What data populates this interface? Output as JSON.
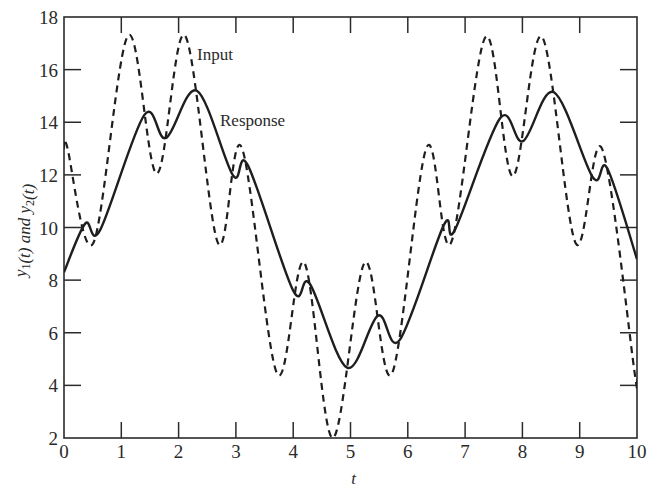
{
  "chart_data": {
    "type": "line",
    "title": "",
    "xlabel": "t",
    "ylabel": "y1(t) and y2(t)",
    "xlim": [
      0,
      10
    ],
    "ylim": [
      2,
      18
    ],
    "xticks": [
      0,
      1,
      2,
      3,
      4,
      5,
      6,
      7,
      8,
      9,
      10
    ],
    "yticks": [
      2,
      4,
      6,
      8,
      10,
      12,
      14,
      16,
      18
    ],
    "grid": false,
    "legend": "inline annotations",
    "annotations": [
      {
        "text": "Input",
        "x": 2.33,
        "y": 16.5
      },
      {
        "text": "Response",
        "x": 2.73,
        "y": 14.0
      }
    ],
    "series": [
      {
        "name": "Input",
        "style": "dashed",
        "x": [
          0,
          0.05,
          0.51,
          1.12,
          1.62,
          2.11,
          2.69,
          3.1,
          3.72,
          4.19,
          4.69,
          5.25,
          5.72,
          6.33,
          6.75,
          7.36,
          7.83,
          8.34,
          8.93,
          9.39,
          9.97,
          10
        ],
        "y": [
          13.0,
          13.1,
          9.4,
          17.3,
          12.05,
          17.3,
          9.4,
          13.05,
          4.44,
          8.67,
          2.0,
          8.67,
          4.44,
          13.05,
          9.4,
          17.25,
          11.95,
          17.25,
          9.4,
          13.0,
          4.3,
          4.2
        ]
      },
      {
        "name": "Response",
        "style": "solid",
        "x": [
          0,
          0.37,
          0.63,
          1.4,
          1.78,
          2.32,
          2.95,
          3.21,
          4.0,
          4.29,
          4.94,
          5.48,
          5.86,
          6.63,
          6.82,
          7.61,
          8.01,
          8.55,
          9.23,
          9.48,
          10
        ],
        "y": [
          8.3,
          10.15,
          9.9,
          14.27,
          13.4,
          15.2,
          11.98,
          12.36,
          7.6,
          7.86,
          4.67,
          6.65,
          5.73,
          10.1,
          9.9,
          14.15,
          13.28,
          15.14,
          11.9,
          12.25,
          8.8
        ]
      }
    ]
  }
}
